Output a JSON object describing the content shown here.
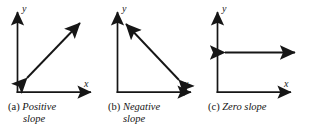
{
  "figure": {
    "type": "slope-illustration",
    "background_color": "#ffffff",
    "stroke_color": "#161616",
    "panel_count": 3
  },
  "panels": [
    {
      "id": "positive-slope",
      "caption_tag": "(a)",
      "caption_line1": "Positive",
      "caption_line2": "slope",
      "y_axis_label": "y",
      "x_axis_label": "x",
      "arrow": {
        "kind": "double-headed",
        "direction": "lower-left-to-upper-right",
        "slope_sign": "positive"
      }
    },
    {
      "id": "negative-slope",
      "caption_tag": "(b)",
      "caption_line1": "Negative",
      "caption_line2": "slope",
      "y_axis_label": "y",
      "x_axis_label": "x",
      "arrow": {
        "kind": "double-headed",
        "direction": "upper-left-to-lower-right",
        "slope_sign": "negative"
      }
    },
    {
      "id": "zero-slope",
      "caption_tag": "(c)",
      "caption_line1": "Zero slope",
      "caption_line2": "",
      "y_axis_label": "y",
      "x_axis_label": "x",
      "arrow": {
        "kind": "double-headed",
        "direction": "horizontal",
        "slope_sign": "zero"
      }
    }
  ]
}
